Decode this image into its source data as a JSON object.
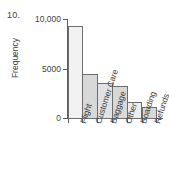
{
  "problem": {
    "number": "10."
  },
  "chart_data": {
    "type": "bar",
    "title": "",
    "xlabel": "",
    "ylabel": "Frequency",
    "categories": [
      "Flight",
      "Customer Care",
      "Baggage",
      "Other",
      "Boarding",
      "Refunds"
    ],
    "values": [
      9300,
      4400,
      3500,
      3200,
      1600,
      1100
    ],
    "ylim": [
      0,
      10000
    ],
    "yticks": [
      0,
      5000,
      10000
    ],
    "ytick_labels": [
      "0",
      "5000",
      "10,000"
    ],
    "grid": false,
    "legend": false,
    "bar_colors": [
      "#f2f2f2",
      "#d8d8d8",
      "#e2e2e2",
      "#d8d8d8",
      "#eeeeee",
      "#d8d8d8"
    ],
    "bar_edge_color": "#6e6e6e",
    "axis_color": "#5d5d5d",
    "text_color": "#3f3f3f",
    "background": "#ffffff"
  }
}
